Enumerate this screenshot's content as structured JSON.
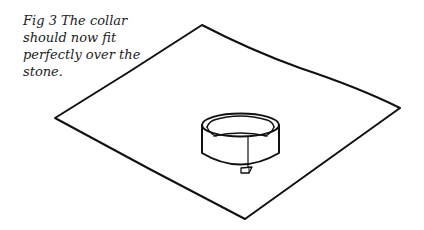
{
  "figure": {
    "caption_lines": [
      "Fig 3 The collar",
      "should now fit",
      "perfectly over the",
      "stone."
    ],
    "illustration": "Line drawing of a flat sheet with a circular collar placed over the stone",
    "colors": {
      "stroke": "#111111",
      "background": "#ffffff"
    }
  }
}
